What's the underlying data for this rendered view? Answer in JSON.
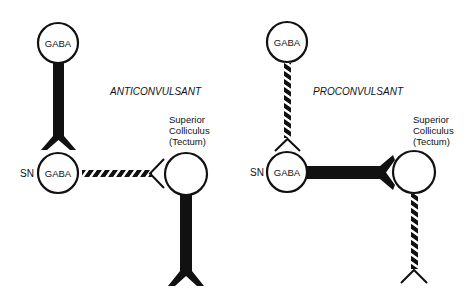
{
  "panels": [
    {
      "id": "anticonvulsant",
      "title": "ANTICONVULSANT",
      "top_neuron_label": "GABA",
      "sn_label": "SN",
      "sn_neuron_label": "GABA",
      "target_label_lines": [
        "Superior",
        "Colliculus",
        "(Tectum)"
      ],
      "top_to_sn_pathway": "solid",
      "sn_to_tectum_pathway": "hatched",
      "tectum_output_pathway": "solid"
    },
    {
      "id": "proconvulsant",
      "title": "PROCONVULSANT",
      "top_neuron_label": "GABA",
      "sn_label": "SN",
      "sn_neuron_label": "GABA",
      "target_label_lines": [
        "Superior",
        "Colliculus",
        "(Tectum)"
      ],
      "top_to_sn_pathway": "hatched",
      "sn_to_tectum_pathway": "solid",
      "tectum_output_pathway": "hatched"
    }
  ],
  "colors": {
    "ink": "#111111",
    "background": "#ffffff"
  }
}
